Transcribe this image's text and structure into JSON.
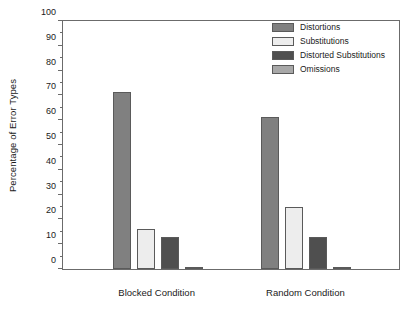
{
  "chart_data": {
    "type": "bar",
    "title": "",
    "xlabel": "",
    "ylabel": "Percentage of Error Types",
    "categories": [
      "Blocked Condition",
      "Random Condition"
    ],
    "series": [
      {
        "name": "Distortions",
        "values": [
          71,
          61
        ],
        "color": "#808080"
      },
      {
        "name": "Substitutions",
        "values": [
          16,
          25
        ],
        "color": "#ededed"
      },
      {
        "name": "Distorted Substitutions",
        "values": [
          13,
          13
        ],
        "color": "#4f4f4f"
      },
      {
        "name": "Omissions",
        "values": [
          1,
          1
        ],
        "color": "#a8a8a8"
      }
    ],
    "ylim": [
      0,
      100
    ],
    "ytick_step": 10,
    "yminor_step": 5,
    "ytick_labels": [
      "0",
      "10",
      "20",
      "30",
      "40",
      "50",
      "60",
      "70",
      "80",
      "90",
      "100"
    ],
    "grid": false,
    "legend_position": "top-right",
    "frame_color": "#6b6b6b"
  }
}
